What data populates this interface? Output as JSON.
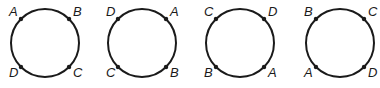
{
  "figure": {
    "colors": {
      "stroke": "#1a1a1a",
      "background": "#ffffff"
    },
    "circles": [
      {
        "id": 1,
        "cx": 45,
        "cy": 43,
        "r": 34,
        "top_left": "A",
        "top_right": "B",
        "bottom_left": "D",
        "bottom_right": "C"
      },
      {
        "id": 2,
        "cx": 142,
        "cy": 43,
        "r": 34,
        "top_left": "D",
        "top_right": "A",
        "bottom_left": "C",
        "bottom_right": "B"
      },
      {
        "id": 3,
        "cx": 240,
        "cy": 43,
        "r": 34,
        "top_left": "C",
        "top_right": "D",
        "bottom_left": "B",
        "bottom_right": "A"
      },
      {
        "id": 4,
        "cx": 340,
        "cy": 43,
        "r": 34,
        "top_left": "B",
        "top_right": "C",
        "bottom_left": "A",
        "bottom_right": "D"
      }
    ]
  }
}
